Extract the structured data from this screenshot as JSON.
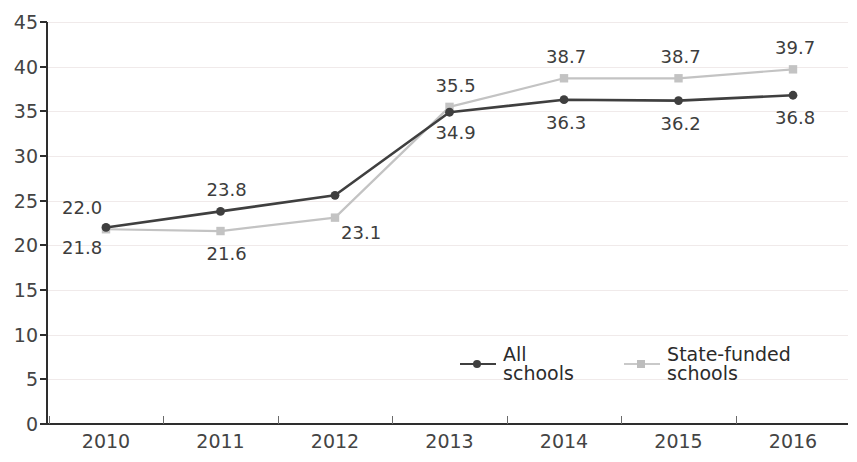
{
  "chart_data": {
    "type": "line",
    "title": "",
    "xlabel": "",
    "ylabel": "",
    "categories": [
      "2010",
      "2011",
      "2012",
      "2013",
      "2014",
      "2015",
      "2016"
    ],
    "ylim": [
      0,
      45
    ],
    "yticks": [
      0,
      5,
      10,
      15,
      20,
      25,
      30,
      35,
      40,
      45
    ],
    "grid": true,
    "legend_position": "inside-bottom-center",
    "series": [
      {
        "name": "All schools",
        "color": "#3f3f3f",
        "marker": "circle",
        "linestyle": "solid",
        "values": [
          22.0,
          23.8,
          25.6,
          34.9,
          36.3,
          36.2,
          36.8
        ],
        "labels": [
          "22.0",
          "23.8",
          "",
          "34.9",
          "36.3",
          "36.2",
          "36.8"
        ]
      },
      {
        "name": "State-funded schools",
        "color": "#c3c3c3",
        "marker": "square",
        "linestyle": "solid",
        "values": [
          21.8,
          21.6,
          23.1,
          35.5,
          38.7,
          38.7,
          39.7
        ],
        "labels": [
          "21.8",
          "21.6",
          "23.1",
          "35.5",
          "38.7",
          "38.7",
          "39.7"
        ]
      }
    ]
  },
  "axis": {
    "ytick_labels": [
      "0",
      "5",
      "10",
      "15",
      "20",
      "25",
      "30",
      "35",
      "40",
      "45"
    ],
    "xtick_labels": [
      "2010",
      "2011",
      "2012",
      "2013",
      "2014",
      "2015",
      "2016"
    ]
  },
  "legend": {
    "items": [
      {
        "label": "All schools",
        "color": "#3f3f3f",
        "marker": "circle"
      },
      {
        "label": "State-funded schools",
        "color": "#c3c3c3",
        "marker": "square"
      }
    ]
  },
  "colors": {
    "all_schools": "#3f3f3f",
    "state_funded": "#c3c3c3",
    "axis": "#2e2e2e",
    "grid": "#f0eaea",
    "text": "#3d3d3d",
    "background": "#ffffff"
  }
}
